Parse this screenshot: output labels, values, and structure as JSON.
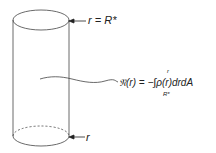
{
  "diagram": {
    "top_label": "r = R*",
    "bottom_label": "r",
    "formula": {
      "lhs": "𝔑(r) = −",
      "integral_sign": "∫",
      "integrand": "ρ(r)drdA",
      "upper_limit": "r",
      "lower_limit": "R*"
    },
    "colors": {
      "stroke": "#444444",
      "text": "#222222",
      "background": "#ffffff"
    }
  }
}
